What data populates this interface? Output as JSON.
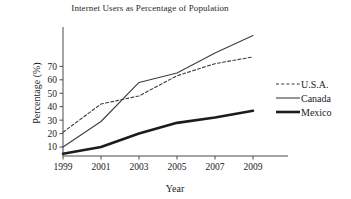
{
  "chart_data": {
    "type": "line",
    "title": "Internet Users as Percentage of Population",
    "xlabel": "Year",
    "ylabel": "Percentage (%)",
    "x": [
      1999,
      2001,
      2003,
      2005,
      2007,
      2009
    ],
    "xtick_labels": [
      "1999",
      "2001",
      "2003",
      "2005",
      "2007",
      "2009"
    ],
    "ytick_labels": [
      "10",
      "20",
      "30",
      "40",
      "50",
      "60",
      "70"
    ],
    "yticks": [
      10,
      20,
      30,
      40,
      50,
      60,
      70
    ],
    "xlim": [
      1999,
      2009
    ],
    "ylim": [
      0,
      100
    ],
    "grid": false,
    "legend_position": "right",
    "series": [
      {
        "name": "U.S.A.",
        "style": "dashed",
        "values": [
          21,
          42,
          48,
          63,
          72,
          77
        ]
      },
      {
        "name": "Canada",
        "style": "solid-thin",
        "values": [
          10,
          29,
          58,
          65,
          80,
          93
        ]
      },
      {
        "name": "Mexico",
        "style": "solid-thick",
        "values": [
          5,
          10,
          20,
          28,
          32,
          37
        ]
      }
    ]
  },
  "legend": {
    "items": [
      {
        "label": "U.S.A."
      },
      {
        "label": "Canada"
      },
      {
        "label": "Mexico"
      }
    ]
  }
}
